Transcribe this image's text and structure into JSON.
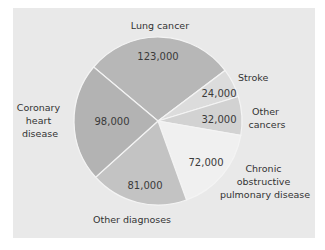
{
  "chart_data": {
    "type": "pie",
    "title": "",
    "total": 430000,
    "start_angle_deg": 220,
    "slices": [
      {
        "label": "Lung cancer",
        "value": 123000,
        "value_label": "123,000",
        "color": "#b7b7b7"
      },
      {
        "label": "Stroke",
        "value": 24000,
        "value_label": "24,000",
        "color": "#dcdcdc"
      },
      {
        "label": "Other cancers",
        "value": 32000,
        "value_label": "32,000",
        "color": "#d2d2d2"
      },
      {
        "label": "Chronic obstructive pulmonary disease",
        "value": 72000,
        "value_label": "72,000",
        "color": "#f0f0f0"
      },
      {
        "label": "Other diagnoses",
        "value": 81000,
        "value_label": "81,000",
        "color": "#c3c3c3"
      },
      {
        "label": "Coronary heart disease",
        "value": 98000,
        "value_label": "98,000",
        "color": "#b3b3b3"
      }
    ],
    "legend": "none (labels placed outside slices)"
  },
  "labels": {
    "lung": [
      "Lung cancer"
    ],
    "stroke": [
      "Stroke"
    ],
    "other_cancers": [
      "Other",
      "cancers"
    ],
    "copd": [
      "Chronic",
      "obstructive",
      "pulmonary disease"
    ],
    "other_diag": [
      "Other diagnoses"
    ],
    "chd": [
      "Coronary",
      "heart",
      "disease"
    ]
  },
  "values": {
    "lung": "123,000",
    "stroke": "24,000",
    "other_cancers": "32,000",
    "copd": "72,000",
    "other_diag": "81,000",
    "chd": "98,000"
  },
  "colors": {
    "background": "#e9e9e9",
    "separator": "#f4f4f4"
  }
}
